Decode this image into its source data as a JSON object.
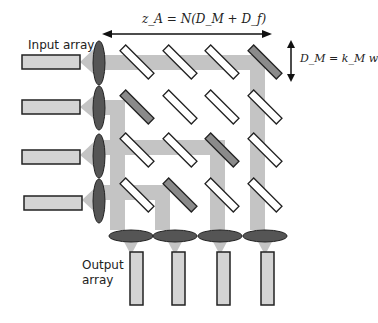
{
  "labels": {
    "input_array": "Input array",
    "output_array_line1": "Output",
    "output_array_line2": "array",
    "z_formula": "z_A = N(D_M + D_f)",
    "d_formula": "D_M = k_M w"
  },
  "colors": {
    "beam": "#c4c4c4",
    "element_fill": "#d4d4d4",
    "lens_fill": "#555555",
    "mirror_active": "#8a8a8a",
    "mirror_inactive": "#ffffff",
    "stroke": "#222222"
  },
  "grid": {
    "rows": 4,
    "cols": 4,
    "active_mirrors": [
      [
        0,
        3
      ],
      [
        1,
        0
      ],
      [
        2,
        2
      ],
      [
        3,
        1
      ]
    ]
  }
}
